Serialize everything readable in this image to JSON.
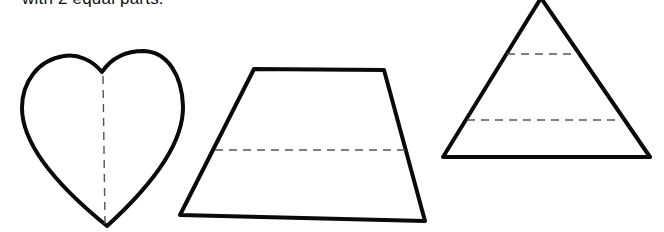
{
  "worksheet": {
    "instruction_text": "with 2 equal parts.",
    "shapes": [
      {
        "name": "heart",
        "divider_count": 1,
        "divider_orientation": "vertical",
        "parts": 2
      },
      {
        "name": "trapezoid",
        "divider_count": 1,
        "divider_orientation": "horizontal",
        "parts": 2
      },
      {
        "name": "triangle",
        "divider_count": 2,
        "divider_orientation": "horizontal",
        "parts": 3
      }
    ],
    "colors": {
      "outline": "#0a0a0a",
      "divider": "#555555",
      "background": "#ffffff"
    }
  }
}
